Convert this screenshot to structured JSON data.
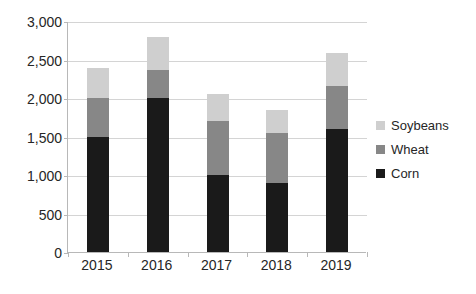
{
  "chart_data": {
    "type": "bar",
    "subtype": "stacked-bar",
    "title": "",
    "xlabel": "",
    "ylabel": "",
    "categories": [
      "2015",
      "2016",
      "2017",
      "2018",
      "2019"
    ],
    "series": [
      {
        "name": "Corn",
        "color": "#1a1a1a",
        "values": [
          1500,
          2000,
          1000,
          900,
          1600
        ]
      },
      {
        "name": "Wheat",
        "color": "#878787",
        "values": [
          500,
          365,
          700,
          650,
          550
        ]
      },
      {
        "name": "Soybeans",
        "color": "#cfcfcf",
        "values": [
          390,
          425,
          350,
          290,
          440
        ]
      }
    ],
    "stack_totals": [
      2390,
      2790,
      2050,
      1840,
      2590
    ],
    "ylim": [
      0,
      3000
    ],
    "ytick_values": [
      0,
      500,
      1000,
      1500,
      2000,
      2500,
      3000
    ],
    "ytick_labels": [
      "0",
      "500",
      "1,000",
      "1,500",
      "2,000",
      "2,500",
      "3,000"
    ],
    "grid": true,
    "grid_axis": "y",
    "legend_position": "right",
    "legend_order": [
      "Soybeans",
      "Wheat",
      "Corn"
    ]
  },
  "axes": {
    "y_ticks": [
      {
        "label": "3,000",
        "value": 3000
      },
      {
        "label": "2,500",
        "value": 2500
      },
      {
        "label": "2,000",
        "value": 2000
      },
      {
        "label": "1,500",
        "value": 1500
      },
      {
        "label": "1,000",
        "value": 1000
      },
      {
        "label": "500",
        "value": 500
      },
      {
        "label": "0",
        "value": 0
      }
    ],
    "x_ticks": [
      {
        "label": "2015"
      },
      {
        "label": "2016"
      },
      {
        "label": "2017"
      },
      {
        "label": "2018"
      },
      {
        "label": "2019"
      }
    ]
  },
  "legend": {
    "items": [
      {
        "label": "Soybeans",
        "color": "#cfcfcf"
      },
      {
        "label": "Wheat",
        "color": "#878787"
      },
      {
        "label": "Corn",
        "color": "#1a1a1a"
      }
    ]
  },
  "colors": {
    "corn": "#1a1a1a",
    "wheat": "#878787",
    "soybeans": "#cfcfcf",
    "gridline": "#d4d4d4",
    "axis": "#b8b8b8",
    "text": "#262626",
    "background": "#ffffff"
  }
}
